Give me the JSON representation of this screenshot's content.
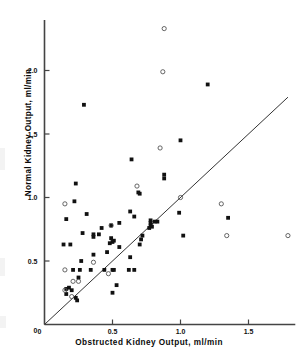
{
  "chart_data": {
    "type": "scatter",
    "title": "",
    "subtitle": "",
    "xlabel": "Obstructed Kidney Output, ml/min",
    "ylabel": "Normal Kidney Output, ml/min",
    "xlim": [
      0,
      1.8
    ],
    "ylim": [
      0,
      2.35
    ],
    "xticks": [
      0,
      0.5,
      1.0,
      1.5
    ],
    "xticklabels": [
      "0",
      "0.5",
      "1.0",
      "1.5"
    ],
    "yticks": [
      0,
      0.5,
      1.0,
      1.5,
      2.0
    ],
    "yticklabels": [
      "0",
      "0.5",
      "1.0",
      "1.5",
      "2.0"
    ],
    "grid": false,
    "legend_position": "none",
    "annotations": [
      {
        "kind": "line",
        "name": "line-of-identity",
        "description": "diagonal line of identity, y = x",
        "x0": 0,
        "y0": 0,
        "x1": 1.79,
        "y1": 1.79,
        "color": "#333333"
      }
    ],
    "series": [
      {
        "name": "filled",
        "marker": "filled-square-dot",
        "color": "#111111",
        "points": [
          [
            0.29,
            1.73
          ],
          [
            1.2,
            1.89
          ],
          [
            1.0,
            1.45
          ],
          [
            0.64,
            1.3
          ],
          [
            0.88,
            1.18
          ],
          [
            0.88,
            1.15
          ],
          [
            0.69,
            1.04
          ],
          [
            0.7,
            1.03
          ],
          [
            0.23,
            1.11
          ],
          [
            0.22,
            0.97
          ],
          [
            0.31,
            0.87
          ],
          [
            0.63,
            0.89
          ],
          [
            0.99,
            0.88
          ],
          [
            0.66,
            0.85
          ],
          [
            1.35,
            0.84
          ],
          [
            0.16,
            0.83
          ],
          [
            0.78,
            0.82
          ],
          [
            0.83,
            0.81
          ],
          [
            0.78,
            0.8
          ],
          [
            0.55,
            0.8
          ],
          [
            0.78,
            0.78
          ],
          [
            0.77,
            0.76
          ],
          [
            0.49,
            0.78
          ],
          [
            0.42,
            0.76
          ],
          [
            0.28,
            0.72
          ],
          [
            0.36,
            0.71
          ],
          [
            0.36,
            0.69
          ],
          [
            0.4,
            0.71
          ],
          [
            0.72,
            0.7
          ],
          [
            1.02,
            0.7
          ],
          [
            0.71,
            0.67
          ],
          [
            0.49,
            0.68
          ],
          [
            0.51,
            0.66
          ],
          [
            0.5,
            0.65
          ],
          [
            0.48,
            0.64
          ],
          [
            0.7,
            0.63
          ],
          [
            0.14,
            0.63
          ],
          [
            0.19,
            0.63
          ],
          [
            0.55,
            0.61
          ],
          [
            0.46,
            0.57
          ],
          [
            0.36,
            0.55
          ],
          [
            0.27,
            0.5
          ],
          [
            0.63,
            0.53
          ],
          [
            0.21,
            0.43
          ],
          [
            0.26,
            0.43
          ],
          [
            0.34,
            0.43
          ],
          [
            0.44,
            0.43
          ],
          [
            0.5,
            0.43
          ],
          [
            0.51,
            0.43
          ],
          [
            0.62,
            0.43
          ],
          [
            0.66,
            0.43
          ],
          [
            0.25,
            0.37
          ],
          [
            0.53,
            0.31
          ],
          [
            0.16,
            0.28
          ],
          [
            0.18,
            0.29
          ],
          [
            0.2,
            0.27
          ],
          [
            0.16,
            0.24
          ],
          [
            0.5,
            0.25
          ],
          [
            0.23,
            0.21
          ],
          [
            0.24,
            0.19
          ],
          [
            0.81,
            0.81
          ],
          [
            0.79,
            0.77
          ]
        ]
      },
      {
        "name": "open",
        "marker": "open-circle",
        "color": "#555555",
        "points": [
          [
            0.88,
            2.33
          ],
          [
            0.87,
            1.99
          ],
          [
            0.85,
            1.39
          ],
          [
            0.68,
            1.09
          ],
          [
            0.15,
            0.95
          ],
          [
            1.3,
            0.95
          ],
          [
            1.0,
            1.0
          ],
          [
            0.49,
            0.78
          ],
          [
            1.34,
            0.7
          ],
          [
            1.79,
            0.7
          ],
          [
            0.36,
            0.49
          ],
          [
            0.15,
            0.43
          ],
          [
            0.21,
            0.34
          ],
          [
            0.25,
            0.34
          ],
          [
            0.47,
            0.4
          ],
          [
            0.15,
            0.27
          ],
          [
            0.2,
            0.22
          ]
        ]
      }
    ]
  },
  "axis": {
    "x_title": "Obstructed Kidney Output, ml/min",
    "y_title": "Normal Kidney Output, ml/min"
  }
}
